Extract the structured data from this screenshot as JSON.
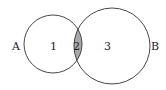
{
  "diagram": {
    "type": "venn",
    "sets": [
      {
        "label": "A",
        "region_label": "1"
      },
      {
        "label": "B",
        "region_label": "3"
      }
    ],
    "intersection": {
      "label": "2",
      "fill": "#a9a9a9"
    },
    "colors": {
      "stroke": "#333333",
      "background": "#ffffff",
      "intersection": "#a9a9a9"
    }
  }
}
